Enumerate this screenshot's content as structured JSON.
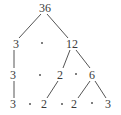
{
  "diagram": {
    "type": "factor-tree",
    "root": "36",
    "nodes": [
      {
        "id": "n36",
        "label": "36",
        "x": 45,
        "y": 8
      },
      {
        "id": "n3a",
        "label": "3",
        "x": 16,
        "y": 44
      },
      {
        "id": "n12",
        "label": "12",
        "x": 72,
        "y": 44
      },
      {
        "id": "n3b",
        "label": "3",
        "x": 13,
        "y": 75
      },
      {
        "id": "n2a",
        "label": "2",
        "x": 60,
        "y": 75
      },
      {
        "id": "n6",
        "label": "6",
        "x": 92,
        "y": 75
      },
      {
        "id": "n3c",
        "label": "3",
        "x": 13,
        "y": 104
      },
      {
        "id": "n2b",
        "label": "2",
        "x": 44,
        "y": 104
      },
      {
        "id": "n2c",
        "label": "2",
        "x": 74,
        "y": 104
      },
      {
        "id": "n3d",
        "label": "3",
        "x": 108,
        "y": 104
      }
    ],
    "dots": [
      {
        "x": 42,
        "y": 43
      },
      {
        "x": 40,
        "y": 75
      },
      {
        "x": 76,
        "y": 74
      },
      {
        "x": 30,
        "y": 104
      },
      {
        "x": 62,
        "y": 104
      },
      {
        "x": 92,
        "y": 103
      }
    ],
    "edges": [
      {
        "from": "n36",
        "to": "n3a",
        "x1": 41,
        "y1": 14,
        "x2": 19,
        "y2": 38
      },
      {
        "from": "n36",
        "to": "n12",
        "x1": 47,
        "y1": 14,
        "x2": 68,
        "y2": 38
      },
      {
        "from": "n3a",
        "to": "n3b",
        "x1": 14,
        "y1": 50,
        "x2": 14,
        "y2": 68
      },
      {
        "from": "n3b",
        "to": "n3c",
        "x1": 14,
        "y1": 81,
        "x2": 14,
        "y2": 98
      },
      {
        "from": "n12",
        "to": "n2a",
        "x1": 70,
        "y1": 50,
        "x2": 63,
        "y2": 68
      },
      {
        "from": "n12",
        "to": "n6",
        "x1": 76,
        "y1": 50,
        "x2": 90,
        "y2": 68
      },
      {
        "from": "n2a",
        "to": "n2b",
        "x1": 58,
        "y1": 81,
        "x2": 47,
        "y2": 98
      },
      {
        "from": "n6",
        "to": "n2c",
        "x1": 90,
        "y1": 81,
        "x2": 78,
        "y2": 98
      },
      {
        "from": "n6",
        "to": "n3d",
        "x1": 95,
        "y1": 81,
        "x2": 106,
        "y2": 98
      }
    ],
    "line_color": "#555555"
  }
}
